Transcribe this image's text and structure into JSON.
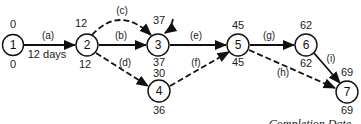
{
  "diagram": {
    "type": "activity-on-arrow network (CPM)",
    "nodes": [
      {
        "id": "1",
        "label": "1",
        "early": "0",
        "late": "0"
      },
      {
        "id": "2",
        "label": "2",
        "early": "12",
        "late": "12"
      },
      {
        "id": "3",
        "label": "3",
        "early": "37",
        "late": "37"
      },
      {
        "id": "4",
        "label": "4",
        "early": "30",
        "late": "36"
      },
      {
        "id": "5",
        "label": "5",
        "early": "45",
        "late": "45"
      },
      {
        "id": "6",
        "label": "6",
        "early": "62",
        "late": "62"
      },
      {
        "id": "7",
        "label": "7",
        "early": "69",
        "late": "69"
      }
    ],
    "activities": [
      {
        "id": "a",
        "label": "(a)",
        "from": "1",
        "to": "2",
        "style": "solid",
        "duration_label": "12  days"
      },
      {
        "id": "b",
        "label": "(b)",
        "from": "2",
        "to": "3",
        "style": "solid"
      },
      {
        "id": "c",
        "label": "(c)",
        "from": "2",
        "to": "3",
        "style": "dashed"
      },
      {
        "id": "d",
        "label": "(d)",
        "from": "2",
        "to": "4",
        "style": "dashed"
      },
      {
        "id": "e",
        "label": "(e)",
        "from": "3",
        "to": "5",
        "style": "solid"
      },
      {
        "id": "f",
        "label": "(f)",
        "from": "4",
        "to": "5",
        "style": "dashed"
      },
      {
        "id": "g",
        "label": "(g)",
        "from": "5",
        "to": "6",
        "style": "solid"
      },
      {
        "id": "h",
        "label": "(h)",
        "from": "5",
        "to": "7",
        "style": "dashed"
      },
      {
        "id": "i",
        "label": "(i)",
        "from": "6",
        "to": "7",
        "style": "solid"
      }
    ],
    "caption": "Completion Date"
  }
}
